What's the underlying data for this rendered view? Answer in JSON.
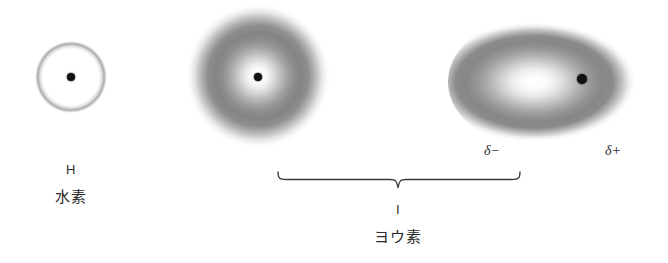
{
  "figure": {
    "background_color": "#ffffff",
    "nucleus_color": "#111111",
    "text_color": "#2b2b2b"
  },
  "atoms": [
    {
      "id": "hydrogen",
      "symbol": "H",
      "name_ja": "水素",
      "cloud_shape": "ring",
      "cloud": {
        "cx": 71,
        "cy": 77,
        "rx": 36,
        "ry": 36
      },
      "nucleus": {
        "cx": 71,
        "cy": 77,
        "r": 4
      }
    },
    {
      "id": "iodine-free",
      "symbol": "I",
      "name_ja": "ヨウ素",
      "cloud_shape": "sphere",
      "cloud": {
        "cx": 258,
        "cy": 76,
        "rx": 72,
        "ry": 72
      },
      "nucleus": {
        "cx": 258,
        "cy": 77,
        "r": 4
      }
    },
    {
      "id": "iodine-polarised",
      "symbol": "I",
      "name_ja": "ヨウ素",
      "cloud_shape": "ellipse",
      "cloud": {
        "cx": 546,
        "cy": 82,
        "rx": 98,
        "ry": 68
      },
      "nucleus": {
        "cx": 582,
        "cy": 79,
        "r": 5
      }
    }
  ],
  "charges": {
    "negative": "δ−",
    "positive": "δ+"
  },
  "brace": {
    "label_symbol": "I",
    "label_ja": "ヨウ素",
    "left": 277,
    "right": 520,
    "tip_x": 398,
    "top_y": 174
  },
  "labels": {
    "hydrogen_symbol": "H",
    "hydrogen_ja": "水素",
    "iodine_symbol": "I",
    "iodine_ja": "ヨウ素",
    "delta_minus": "δ−",
    "delta_plus": "δ+"
  }
}
